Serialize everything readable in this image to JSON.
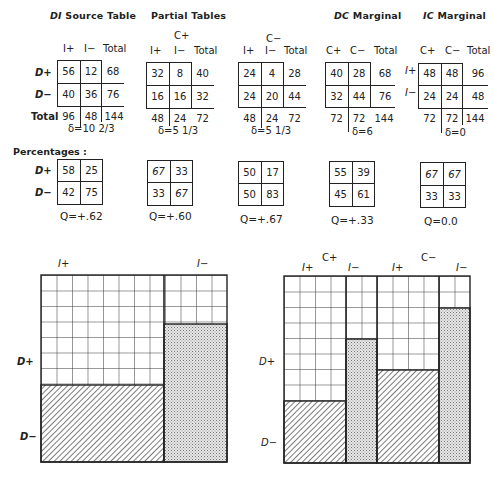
{
  "titles": {
    "di_source": {
      "prefix": "DI",
      "rest": " Source Table"
    },
    "partial": "Partial Tables",
    "dc_marginal": {
      "prefix": "DC",
      "rest": " Marginal"
    },
    "ic_marginal": {
      "prefix": "IC",
      "rest": " Marginal"
    }
  },
  "tables": {
    "di": {
      "col_headers": [
        "I+",
        "I−",
        "Total"
      ],
      "row_headers": [
        "D+",
        "D−",
        "Total"
      ],
      "cells": [
        [
          "56",
          "12",
          "68"
        ],
        [
          "40",
          "36",
          "76"
        ],
        [
          "96",
          "48",
          "144"
        ]
      ],
      "delta": "δ=10 2/3"
    },
    "c_plus": {
      "group": "C+",
      "col_headers": [
        "I+",
        "I−",
        "Total"
      ],
      "cells": [
        [
          "32",
          "8",
          "40"
        ],
        [
          "16",
          "16",
          "32"
        ],
        [
          "48",
          "24",
          "72"
        ]
      ],
      "delta": "δ=5 1/3"
    },
    "c_minus": {
      "group": "C−",
      "col_headers": [
        "I+",
        "I−",
        "Total"
      ],
      "cells": [
        [
          "24",
          "4",
          "28"
        ],
        [
          "24",
          "20",
          "44"
        ],
        [
          "48",
          "24",
          "72"
        ]
      ],
      "delta": "δ=5 1/3"
    },
    "dc": {
      "col_headers": [
        "C+",
        "C−",
        "Total"
      ],
      "cells": [
        [
          "40",
          "28",
          "68"
        ],
        [
          "32",
          "44",
          "76"
        ],
        [
          "72",
          "72",
          "144"
        ]
      ],
      "delta": "δ=6"
    },
    "ic": {
      "col_headers": [
        "C+",
        "C−",
        "Total"
      ],
      "row_headers": [
        "I+",
        "I−"
      ],
      "cells": [
        [
          "48",
          "48",
          "96"
        ],
        [
          "24",
          "24",
          "48"
        ],
        [
          "72",
          "72",
          "144"
        ]
      ],
      "delta": "δ=0"
    }
  },
  "percentages": {
    "label": "Percentages :",
    "row_headers": [
      "D+",
      "D−"
    ],
    "tables": [
      {
        "cells": [
          [
            "58",
            "25"
          ],
          [
            "42",
            "75"
          ]
        ],
        "q": "Q=+.62"
      },
      {
        "cells": [
          [
            "67",
            "33"
          ],
          [
            "33",
            "67"
          ]
        ],
        "q": "Q=+.60"
      },
      {
        "cells": [
          [
            "50",
            "17"
          ],
          [
            "50",
            "83"
          ]
        ],
        "q": "Q=+.67"
      },
      {
        "cells": [
          [
            "55",
            "39"
          ],
          [
            "45",
            "61"
          ]
        ],
        "q": "Q=+.33"
      },
      {
        "cells": [
          [
            "67",
            "67"
          ],
          [
            "33",
            "33"
          ]
        ],
        "q": "Q=0.0"
      }
    ]
  },
  "diagram_left": {
    "col_labels": [
      "I+",
      "I−"
    ],
    "row_labels": [
      "D+",
      "D−"
    ],
    "columns": [
      {
        "name": "I+",
        "width_share": 96,
        "d_plus_pct": 58,
        "d_minus_pct": 42,
        "fill": "hatch"
      },
      {
        "name": "I−",
        "width_share": 48,
        "d_plus_pct": 25,
        "d_minus_pct": 75,
        "fill": "stipple"
      }
    ]
  },
  "diagram_right": {
    "group_labels": [
      "C+",
      "C−"
    ],
    "col_labels": [
      "I+",
      "I−",
      "I+",
      "I−"
    ],
    "row_labels": [
      "D+",
      "D−"
    ],
    "columns": [
      {
        "group": "C+",
        "name": "I+",
        "width_share": 48,
        "d_plus_pct": 67,
        "d_minus_pct": 33,
        "fill": "hatch"
      },
      {
        "group": "C+",
        "name": "I−",
        "width_share": 24,
        "d_plus_pct": 33,
        "d_minus_pct": 67,
        "fill": "stipple"
      },
      {
        "group": "C−",
        "name": "I+",
        "width_share": 48,
        "d_plus_pct": 50,
        "d_minus_pct": 50,
        "fill": "hatch"
      },
      {
        "group": "C−",
        "name": "I−",
        "width_share": 24,
        "d_plus_pct": 17,
        "d_minus_pct": 83,
        "fill": "stipple"
      }
    ]
  },
  "colors": {
    "ink": "#222222",
    "paper": "#ffffff",
    "stipple": "#bdbdbd"
  }
}
